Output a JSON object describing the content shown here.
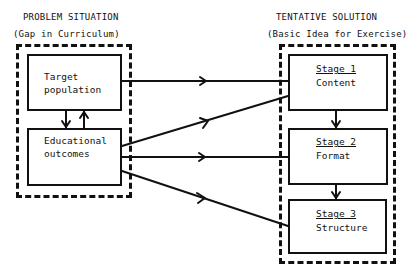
{
  "left_panel": {
    "title": "PROBLEM SITUATION",
    "subtitle": "(Gap in Curriculum)",
    "boxes": [
      {
        "id": "target",
        "lines": [
          "Target",
          "population"
        ]
      },
      {
        "id": "outcomes",
        "lines": [
          "Educational",
          "outcomes"
        ]
      }
    ]
  },
  "right_panel": {
    "title": "TENTATIVE SOLUTION",
    "subtitle": "(Basic Idea for Exercise)",
    "stages": [
      {
        "stage": "Stage 1",
        "name": "Content"
      },
      {
        "stage": "Stage 2",
        "name": "Format"
      },
      {
        "stage": "Stage 3",
        "name": "Structure"
      }
    ]
  },
  "connections": [
    {
      "from": "Target population",
      "to": "Stage 1"
    },
    {
      "from": "Educational outcomes",
      "to": "Stage 1"
    },
    {
      "from": "Educational outcomes",
      "to": "Stage 2"
    },
    {
      "from": "Educational outcomes",
      "to": "Stage 3"
    },
    {
      "from": "Target population",
      "to": "Educational outcomes"
    },
    {
      "from": "Educational outcomes",
      "to": "Target population"
    },
    {
      "from": "Stage 1",
      "to": "Stage 2"
    },
    {
      "from": "Stage 2",
      "to": "Stage 3"
    }
  ]
}
